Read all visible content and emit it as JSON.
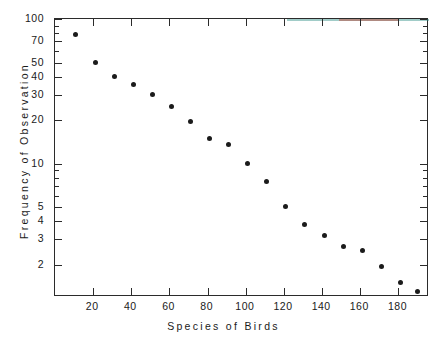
{
  "chart_data": {
    "type": "scatter",
    "title": "",
    "xlabel": "Species of Birds",
    "ylabel": "Frequency of Observation",
    "xlim": [
      0,
      196
    ],
    "ylim": [
      1.2,
      100
    ],
    "yscale": "log",
    "xscale": "linear",
    "grid": false,
    "legend": null,
    "marker": "filled-circle",
    "marker_color": "#1b1b1b",
    "xticks": [
      20,
      40,
      60,
      80,
      100,
      120,
      140,
      160,
      180
    ],
    "xticklabels": [
      "20",
      "40",
      "60",
      "80",
      "100",
      "120",
      "140",
      "160",
      "180"
    ],
    "yticks": [
      2,
      3,
      4,
      5,
      10,
      20,
      30,
      40,
      50,
      70,
      100
    ],
    "yticklabels": [
      "2",
      "3",
      "4",
      "5",
      "10",
      "20",
      "30",
      "40",
      "50",
      "70",
      "100"
    ],
    "yminorticks": [
      6,
      7,
      8,
      9,
      60,
      80,
      90
    ],
    "x": [
      11,
      21,
      31,
      41,
      51,
      61,
      71,
      81,
      91,
      101,
      111,
      121,
      131,
      141,
      151,
      161,
      171,
      181,
      190
    ],
    "values": [
      78,
      50,
      40,
      35,
      30,
      25,
      19.5,
      15,
      13.5,
      10,
      7.5,
      5.1,
      3.8,
      3.2,
      2.7,
      2.5,
      1.95,
      1.5,
      1.3
    ],
    "series": [
      {
        "name": "Observed frequency",
        "x": [
          11,
          21,
          31,
          41,
          51,
          61,
          71,
          81,
          91,
          101,
          111,
          121,
          131,
          141,
          151,
          161,
          171,
          181,
          190
        ],
        "values": [
          78,
          50,
          40,
          35,
          30,
          25,
          19.5,
          15,
          13.5,
          10,
          7.5,
          5.1,
          3.8,
          3.2,
          2.7,
          2.5,
          1.95,
          1.5,
          1.3
        ]
      }
    ]
  },
  "axes": {
    "x_title": "Species of Birds",
    "y_title": "Frequency of Observation"
  },
  "colors": {
    "background": "#ffffff",
    "axis": "#2b2b2b",
    "marker": "#1b1b1b",
    "text": "#1a1a1a",
    "tint_red": "#c0392b",
    "tint_teal": "#2f8f86"
  }
}
